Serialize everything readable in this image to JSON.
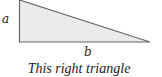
{
  "figure": {
    "shape": "right-triangle",
    "fill_color": "#ebebeb",
    "stroke_color": "#666666",
    "vertices": {
      "top": [
        19,
        0
      ],
      "right_angle": [
        19,
        42
      ],
      "right": [
        150,
        42
      ]
    },
    "labels": {
      "vertical_side": "a",
      "horizontal_side": "b"
    }
  },
  "caption": "This right triangle"
}
